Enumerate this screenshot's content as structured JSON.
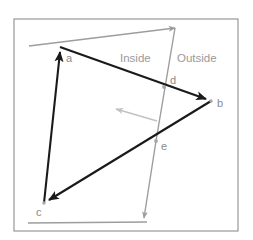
{
  "figure": {
    "canvas": {
      "width": 253,
      "height": 240
    },
    "frame": {
      "x": 14,
      "y": 19,
      "width": 224,
      "height": 212,
      "color": "#8e8e8e"
    },
    "colors": {
      "polygon_edge": "#1a1a1a",
      "clip_line": "#9d9d9d",
      "normal_arrow": "#c2c2c2",
      "label_text": "#9a9a9a",
      "vertex_text": "#8a8a8a",
      "frame": "#8e8e8e",
      "background": "#ffffff"
    },
    "region_labels": [
      {
        "id": "inside",
        "text": "Inside",
        "x": 120,
        "y": 62
      },
      {
        "id": "outside",
        "text": "Outside",
        "x": 177,
        "y": 62
      }
    ],
    "vertices": [
      {
        "id": "a",
        "label": "a",
        "x": 60,
        "y": 47,
        "label_x": 66,
        "label_y": 62,
        "kind": "polygon-vertex"
      },
      {
        "id": "b",
        "label": "b",
        "x": 211,
        "y": 101,
        "label_x": 217,
        "label_y": 107,
        "kind": "polygon-vertex"
      },
      {
        "id": "c",
        "label": "c",
        "x": 44,
        "y": 203,
        "label_x": 36,
        "label_y": 216,
        "kind": "polygon-vertex"
      },
      {
        "id": "d",
        "label": "d",
        "x": 164,
        "y": 87,
        "label_x": 170,
        "label_y": 84,
        "kind": "intersection"
      },
      {
        "id": "e",
        "label": "e",
        "x": 156,
        "y": 141,
        "label_x": 161,
        "label_y": 150,
        "kind": "intersection"
      }
    ],
    "polygon_edges": [
      {
        "id": "edge-a-b",
        "from": "a",
        "to": "b",
        "x1": 60,
        "y1": 47,
        "x2": 211,
        "y2": 101,
        "arrow_at": "b"
      },
      {
        "id": "edge-b-c",
        "from": "b",
        "to": "c",
        "x1": 211,
        "y1": 101,
        "x2": 44,
        "y2": 203,
        "arrow_at": "c"
      },
      {
        "id": "edge-c-a",
        "from": "c",
        "to": "a",
        "x1": 44,
        "y1": 203,
        "x2": 60,
        "y2": 47,
        "arrow_at": "a"
      }
    ],
    "clip_boundary": {
      "id": "clip-polyline",
      "points": "29,46 175,28 156,141 144,218",
      "arrow_points": [
        {
          "at": "top-right-corner",
          "x": 175,
          "y": 28
        },
        {
          "at": "bottom-end",
          "x": 144,
          "y": 218
        }
      ]
    },
    "clip_baseline": {
      "id": "clip-baseline",
      "x1": 28,
      "y1": 223,
      "x2": 147,
      "y2": 222
    },
    "normal_arrow": {
      "id": "inward-normal",
      "x1": 157,
      "y1": 121,
      "x2": 113,
      "y2": 108,
      "direction": "points-left-into-inside-region"
    }
  }
}
